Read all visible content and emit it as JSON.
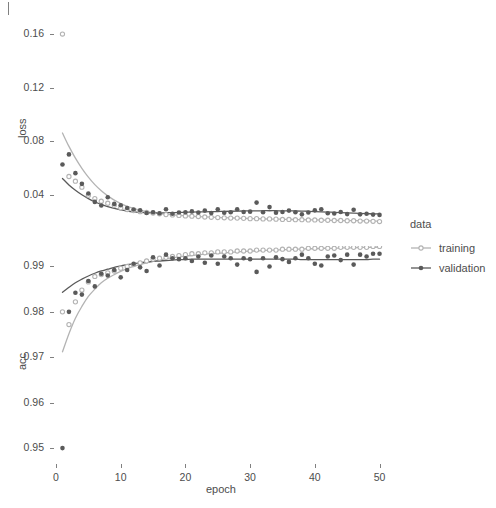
{
  "figure": {
    "xlabel": "epoch",
    "panels": [
      {
        "id": "loss",
        "ylabel": "loss"
      },
      {
        "id": "acc",
        "ylabel": "acc"
      }
    ]
  },
  "legend": {
    "title": "data",
    "entries": [
      {
        "label": "training",
        "color": "#b3b3b3"
      },
      {
        "label": "validation",
        "color": "#5a5a5a"
      }
    ]
  },
  "axis": {
    "x_ticks": [
      "0",
      "10",
      "20",
      "30",
      "40",
      "50"
    ],
    "loss_ticks": [
      "0.16",
      "0.12",
      "0.08",
      "0.04"
    ],
    "acc_ticks": [
      "0.99",
      "0.98",
      "0.97",
      "0.96",
      "0.95"
    ]
  },
  "colors": {
    "training": "#b3b3b3",
    "validation": "#5a5a5a",
    "panel_bg": "#ffffff",
    "axis": "#4d4d4d",
    "tick": "#808080"
  },
  "chart_data": {
    "type": "scatter",
    "title": "",
    "xlabel": "epoch",
    "facets": [
      "loss",
      "acc"
    ],
    "legend_title": "data",
    "legend_position": "right",
    "grid": false,
    "xlim": [
      0,
      51
    ],
    "x": [
      1,
      2,
      3,
      4,
      5,
      6,
      7,
      8,
      9,
      10,
      11,
      12,
      13,
      14,
      15,
      16,
      17,
      18,
      19,
      20,
      21,
      22,
      23,
      24,
      25,
      26,
      27,
      28,
      29,
      30,
      31,
      32,
      33,
      34,
      35,
      36,
      37,
      38,
      39,
      40,
      41,
      42,
      43,
      44,
      45,
      46,
      47,
      48,
      49,
      50
    ],
    "panels": [
      {
        "name": "loss",
        "ylabel": "loss",
        "ylim": [
          0.012,
          0.172
        ],
        "yticks": [
          0.04,
          0.08,
          0.12,
          0.16
        ],
        "series": [
          {
            "name": "training",
            "color": "#b3b3b3",
            "marker": "open-circle",
            "values": [
              0.16,
              0.0535,
              0.05,
              0.0455,
              0.0395,
              0.037,
              0.035,
              0.0335,
              0.032,
              0.03,
              0.0288,
              0.028,
              0.0272,
              0.0266,
              0.0262,
              0.0256,
              0.025,
              0.0248,
              0.0244,
              0.024,
              0.0238,
              0.0236,
              0.0232,
              0.023,
              0.0228,
              0.0226,
              0.0224,
              0.0224,
              0.0222,
              0.022,
              0.022,
              0.0218,
              0.0218,
              0.0216,
              0.0214,
              0.0214,
              0.0212,
              0.0212,
              0.021,
              0.021,
              0.0208,
              0.0208,
              0.0206,
              0.0206,
              0.0204,
              0.0204,
              0.0202,
              0.0202,
              0.02,
              0.0198
            ],
            "smooth": [
              0.086,
              0.076,
              0.0672,
              0.0596,
              0.053,
              0.0474,
              0.0428,
              0.039,
              0.0358,
              0.0332,
              0.0312,
              0.0296,
              0.0283,
              0.0273,
              0.0265,
              0.0258,
              0.0253,
              0.0248,
              0.0244,
              0.0241,
              0.0238,
              0.0235,
              0.0233,
              0.0231,
              0.0229,
              0.0227,
              0.0225,
              0.0224,
              0.0222,
              0.0221,
              0.022,
              0.0218,
              0.0217,
              0.0216,
              0.0215,
              0.0214,
              0.0213,
              0.0212,
              0.0211,
              0.021,
              0.0209,
              0.0208,
              0.0207,
              0.0206,
              0.0205,
              0.0205,
              0.0204,
              0.0203,
              0.0202,
              0.0201
            ]
          },
          {
            "name": "validation",
            "color": "#5a5a5a",
            "marker": "filled-circle",
            "values": [
              0.0625,
              0.07,
              0.056,
              0.048,
              0.0408,
              0.0345,
              0.0318,
              0.038,
              0.033,
              0.032,
              0.03,
              0.0288,
              0.0282,
              0.0262,
              0.0268,
              0.026,
              0.029,
              0.0256,
              0.0266,
              0.0268,
              0.0274,
              0.0266,
              0.028,
              0.0262,
              0.029,
              0.0264,
              0.0268,
              0.029,
              0.027,
              0.0272,
              0.034,
              0.0268,
              0.0306,
              0.0264,
              0.027,
              0.028,
              0.0268,
              0.0252,
              0.0266,
              0.0282,
              0.029,
              0.026,
              0.0258,
              0.027,
              0.0254,
              0.0286,
              0.0252,
              0.0256,
              0.025,
              0.0248
            ],
            "smooth": [
              0.052,
              0.0472,
              0.0432,
              0.0398,
              0.037,
              0.0346,
              0.0326,
              0.031,
              0.0296,
              0.0285,
              0.0277,
              0.0271,
              0.0267,
              0.0264,
              0.0263,
              0.0263,
              0.0264,
              0.0265,
              0.0266,
              0.0268,
              0.0269,
              0.027,
              0.0271,
              0.0272,
              0.0273,
              0.0274,
              0.0275,
              0.0276,
              0.0277,
              0.0278,
              0.0278,
              0.0279,
              0.0279,
              0.0279,
              0.0278,
              0.0278,
              0.0277,
              0.0276,
              0.0275,
              0.0273,
              0.0271,
              0.0269,
              0.0267,
              0.0265,
              0.0263,
              0.0261,
              0.0259,
              0.0257,
              0.0256,
              0.0255
            ]
          }
        ]
      },
      {
        "name": "acc",
        "ylabel": "acc",
        "ylim": [
          0.9465,
          0.9945
        ],
        "yticks": [
          0.95,
          0.96,
          0.97,
          0.98,
          0.99
        ],
        "series": [
          {
            "name": "training",
            "color": "#b3b3b3",
            "marker": "open-circle",
            "values": [
              0.98,
              0.9772,
              0.9822,
              0.9848,
              0.9866,
              0.9878,
              0.9882,
              0.9886,
              0.989,
              0.9896,
              0.99,
              0.9904,
              0.9908,
              0.9912,
              0.9916,
              0.9918,
              0.992,
              0.9922,
              0.9924,
              0.9926,
              0.9928,
              0.9928,
              0.993,
              0.993,
              0.9932,
              0.9932,
              0.9932,
              0.9934,
              0.9934,
              0.9934,
              0.9936,
              0.9936,
              0.9936,
              0.9936,
              0.9938,
              0.9938,
              0.9938,
              0.9938,
              0.994,
              0.994,
              0.994,
              0.994,
              0.994,
              0.9942,
              0.9942,
              0.9942,
              0.9942,
              0.9942,
              0.9944,
              0.9944
            ],
            "smooth": [
              0.9712,
              0.9752,
              0.9786,
              0.9812,
              0.9834,
              0.985,
              0.9864,
              0.9874,
              0.9882,
              0.9889,
              0.9895,
              0.99,
              0.9904,
              0.9908,
              0.9911,
              0.9914,
              0.9917,
              0.9919,
              0.9921,
              0.9923,
              0.9924,
              0.9926,
              0.9927,
              0.9928,
              0.9929,
              0.993,
              0.9931,
              0.9932,
              0.9933,
              0.9934,
              0.9934,
              0.9935,
              0.9936,
              0.9936,
              0.9937,
              0.9937,
              0.9938,
              0.9938,
              0.9939,
              0.9939,
              0.994,
              0.994,
              0.994,
              0.9941,
              0.9941,
              0.9941,
              0.9942,
              0.9942,
              0.9942,
              0.9943
            ]
          },
          {
            "name": "validation",
            "color": "#5a5a5a",
            "marker": "filled-circle",
            "values": [
              0.95,
              0.98,
              0.9842,
              0.9838,
              0.9868,
              0.9856,
              0.9884,
              0.988,
              0.9892,
              0.9876,
              0.9892,
              0.9906,
              0.9898,
              0.989,
              0.992,
              0.9902,
              0.9926,
              0.9918,
              0.9916,
              0.9918,
              0.9912,
              0.9922,
              0.9908,
              0.9924,
              0.9906,
              0.9922,
              0.9918,
              0.9904,
              0.9918,
              0.9916,
              0.9888,
              0.9918,
              0.99,
              0.992,
              0.9916,
              0.991,
              0.9918,
              0.9926,
              0.9918,
              0.9906,
              0.9902,
              0.9922,
              0.9924,
              0.9914,
              0.9926,
              0.9904,
              0.9926,
              0.9922,
              0.9928,
              0.9928
            ],
            "smooth": [
              0.9843,
              0.9854,
              0.9864,
              0.9872,
              0.9879,
              0.9885,
              0.989,
              0.9894,
              0.9898,
              0.9901,
              0.9904,
              0.9906,
              0.9908,
              0.991,
              0.9911,
              0.9912,
              0.9913,
              0.9914,
              0.9915,
              0.9915,
              0.9916,
              0.9916,
              0.9916,
              0.9916,
              0.9916,
              0.9916,
              0.9916,
              0.9916,
              0.9916,
              0.9916,
              0.9916,
              0.9916,
              0.9916,
              0.9916,
              0.9916,
              0.9916,
              0.9916,
              0.9915,
              0.9915,
              0.9915,
              0.9915,
              0.9915,
              0.9915,
              0.9915,
              0.9915,
              0.9915,
              0.9915,
              0.9915,
              0.9916,
              0.9916
            ]
          }
        ]
      }
    ]
  }
}
